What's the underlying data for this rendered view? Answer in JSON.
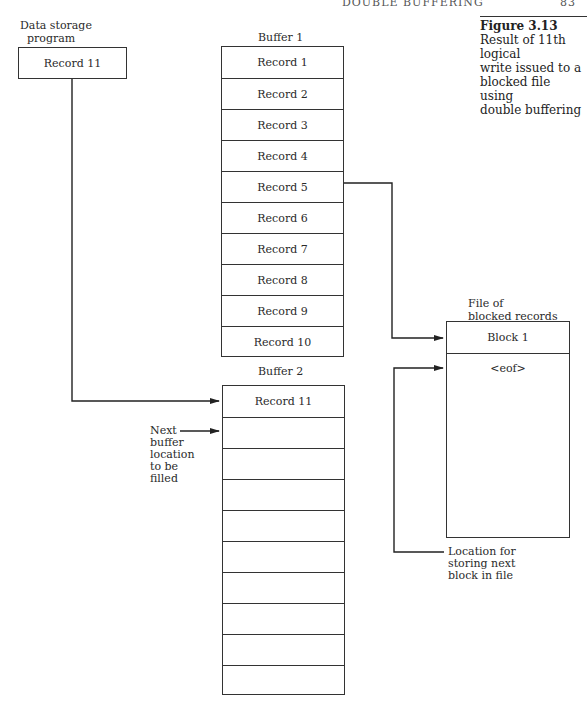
{
  "header": {
    "running_title": "DOUBLE BUFFERING",
    "page_number": "83"
  },
  "caption": {
    "figure_label": "Figure 3.13",
    "text_lines": [
      "Result of 11th logical",
      "write issued to a",
      "blocked file using",
      "double buffering"
    ]
  },
  "program": {
    "label_lines": [
      "Data storage",
      "program"
    ],
    "record": "Record 11"
  },
  "buffer1": {
    "label": "Buffer 1",
    "records": [
      "Record 1",
      "Record 2",
      "Record 3",
      "Record 4",
      "Record 5",
      "Record 6",
      "Record 7",
      "Record 8",
      "Record 9",
      "Record 10"
    ]
  },
  "buffer2": {
    "label": "Buffer 2",
    "records": [
      "Record 11",
      "",
      "",
      "",
      "",
      "",
      "",
      "",
      "",
      ""
    ]
  },
  "file": {
    "label_lines": [
      "File of",
      "blocked records"
    ],
    "block": "Block 1",
    "eof": "<eof>"
  },
  "annotations": {
    "next_buffer": [
      "Next",
      "buffer",
      "location",
      "to be",
      "filled"
    ],
    "next_block": [
      "Location for",
      "storing next",
      "block in file"
    ]
  }
}
